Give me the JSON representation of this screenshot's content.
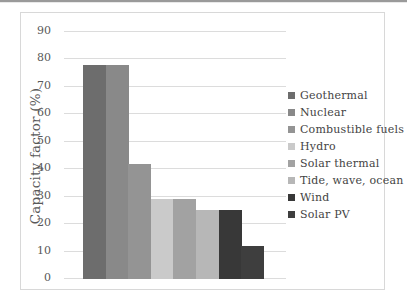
{
  "page": {
    "background": "#ffffff",
    "top_rule_color": "#9a9a9a",
    "frame_border_color": "#d8d8d8",
    "gridline_color": "#dcdcdc",
    "axis_text_color": "#595959"
  },
  "chart_data": {
    "type": "bar",
    "title": "",
    "xlabel": "",
    "ylabel": "Capacity factor (%)",
    "ylim": [
      0,
      90
    ],
    "ytick_step": 10,
    "yticks": [
      90,
      80,
      70,
      60,
      50,
      40,
      30,
      20,
      10,
      0
    ],
    "grid": true,
    "legend_position": "right",
    "categories": [
      "Geothermal",
      "Nuclear",
      "Combustible fuels",
      "Hydro",
      "Solar thermal",
      "Tide, wave, ocean",
      "Wind",
      "Solar PV"
    ],
    "values": [
      78,
      78,
      42,
      29,
      29,
      25,
      25,
      12
    ],
    "colors": [
      "#6d6d6d",
      "#898989",
      "#949494",
      "#cacaca",
      "#a2a2a2",
      "#b7b7b7",
      "#383838",
      "#3e3e3e"
    ]
  }
}
